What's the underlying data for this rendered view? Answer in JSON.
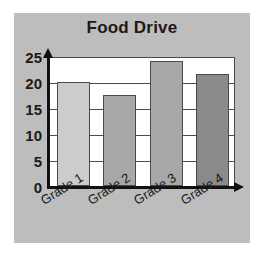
{
  "figure": {
    "width": 265,
    "height": 255,
    "background_color": "#ffffff",
    "panel_color": "#bdbdbd",
    "plot_background_color": "#ffffff",
    "axis_color": "#111111",
    "gridline_color": "#4a4a4a",
    "text_color": "#1a1a1a"
  },
  "chart_data": {
    "type": "bar",
    "title": "Food Drive",
    "xlabel": "",
    "ylabel": "",
    "categories": [
      "Grade 1",
      "Grade 2",
      "Grade 3",
      "Grade 4"
    ],
    "values": [
      20,
      17.5,
      24,
      21.5
    ],
    "bar_colors": [
      "#cccccc",
      "#a8a8a8",
      "#a8a8a8",
      "#8a8a8a"
    ],
    "ylim": [
      0,
      25
    ],
    "yticks": [
      0,
      5,
      10,
      15,
      20,
      25
    ],
    "ytick_labels": [
      "0",
      "5",
      "10",
      "15",
      "20",
      "25"
    ],
    "grid": true,
    "grid_axis": "y",
    "legend": false,
    "legend_position": "none",
    "x_axis_arrow": true,
    "y_axis_arrow": true,
    "xtick_label_rotation": -32
  }
}
